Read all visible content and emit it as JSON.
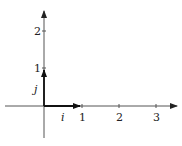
{
  "diagram": {
    "type": "coordinate-axes-unit-vectors",
    "axes": {
      "x_tick_labels": [
        "1",
        "2",
        "3"
      ],
      "y_tick_labels": [
        "1",
        "2"
      ]
    },
    "vectors": [
      {
        "name": "i",
        "label": "i",
        "from": [
          0,
          0
        ],
        "to": [
          1,
          0
        ]
      },
      {
        "name": "j",
        "label": "j",
        "from": [
          0,
          0
        ],
        "to": [
          0,
          1
        ]
      }
    ],
    "colors": {
      "axis": "#555555",
      "vector": "#111111",
      "text": "#222222"
    }
  }
}
